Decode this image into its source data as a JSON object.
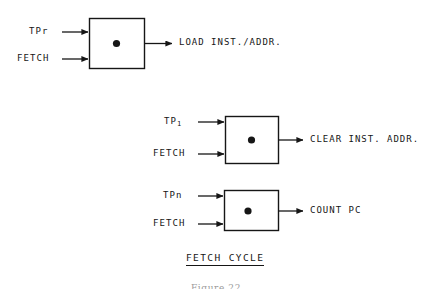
{
  "figure": {
    "section_caption": "FETCH CYCLE",
    "figure_caption": "Figure 22",
    "ink_color": "#161616",
    "background_color": "#ffffff"
  },
  "blocks": [
    {
      "id": "block-load",
      "name": "load-inst-addr-block",
      "inputs": [
        {
          "label": "TPr",
          "name": "input-label-tpr"
        },
        {
          "label": "FETCH",
          "name": "input-label-fetch"
        }
      ],
      "output": {
        "label": "LOAD INST./ADDR.",
        "name": "output-label-load-inst-addr"
      },
      "center_marker": "filled-dot"
    },
    {
      "id": "block-clear",
      "name": "clear-inst-addr-block",
      "inputs": [
        {
          "label": "TP",
          "subscript": "1",
          "name": "input-label-tp1"
        },
        {
          "label": "FETCH",
          "name": "input-label-fetch"
        }
      ],
      "output": {
        "label": "CLEAR INST. ADDR.",
        "name": "output-label-clear-inst-addr"
      },
      "center_marker": "filled-dot"
    },
    {
      "id": "block-count",
      "name": "count-pc-block",
      "inputs": [
        {
          "label": "TPn",
          "name": "input-label-tpn"
        },
        {
          "label": "FETCH",
          "name": "input-label-fetch"
        }
      ],
      "output": {
        "label": "COUNT PC",
        "name": "output-label-count-pc"
      },
      "center_marker": "filled-dot"
    }
  ]
}
